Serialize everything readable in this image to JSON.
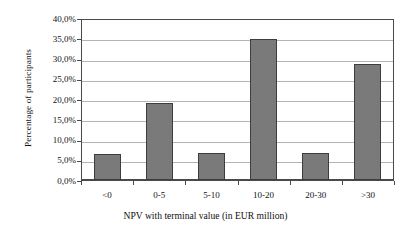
{
  "chart_data": {
    "type": "bar",
    "title": "",
    "subtitle": "",
    "categories": [
      "<0",
      "0-5",
      "5-10",
      "10-20",
      "20-30",
      ">30"
    ],
    "values": [
      6.4,
      19.0,
      6.6,
      34.9,
      6.7,
      28.6
    ],
    "value_labels": [
      "6,4%",
      "19,0%",
      "6,6%",
      "34,9%",
      "6,7%",
      "28,6%"
    ],
    "xlabel": "NPV with terminal value (in EUR million)",
    "ylabel": "Percentage of participants",
    "ylim": [
      0,
      40
    ],
    "ytick_values": [
      40,
      35,
      30,
      25,
      20,
      15,
      10,
      5,
      0
    ],
    "ytick_labels": [
      "40,0%",
      "35,0%",
      "30,0%",
      "25,0%",
      "20,0%",
      "15,0%",
      "10,0%",
      "5,0%",
      "0,0%"
    ],
    "grid": "horizontal",
    "legend": "none",
    "series": [
      {
        "name": "Percentage of participants",
        "values": [
          6.4,
          19.0,
          6.6,
          34.9,
          6.7,
          28.6
        ]
      }
    ],
    "colors": {
      "bar_fill": "#7a7a7a",
      "bar_border": "#3d3d3d",
      "gridline": "#b4b4b4",
      "axis": "#4a4a4a",
      "plot_background": "#ffffff",
      "text": "#111111"
    }
  }
}
